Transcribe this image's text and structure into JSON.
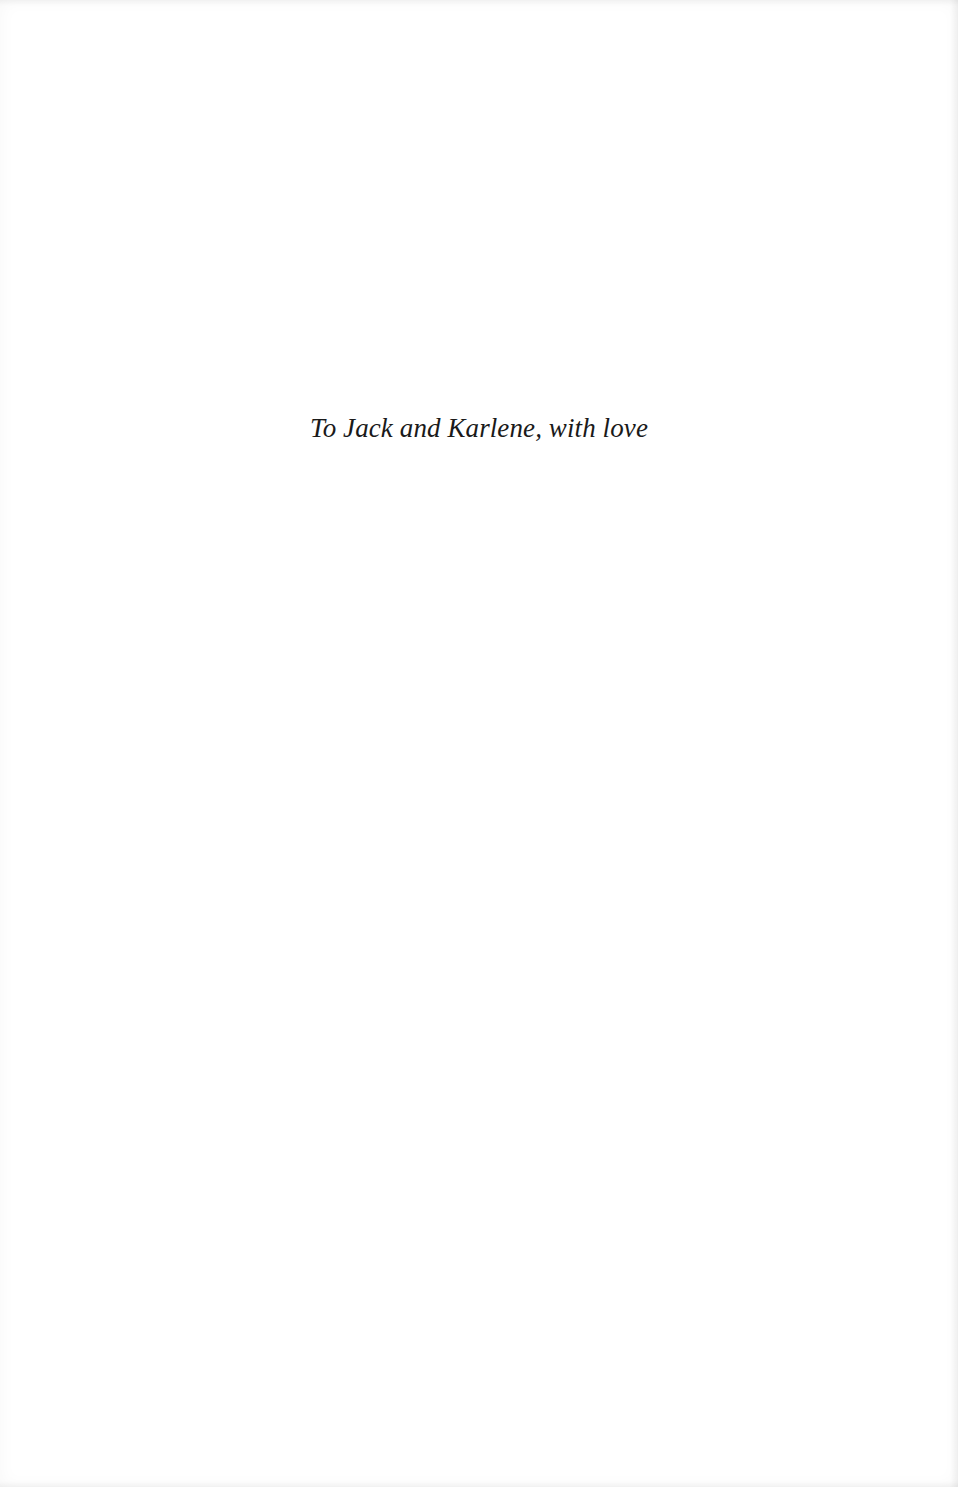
{
  "page": {
    "type": "dedication",
    "background_color": "#ffffff",
    "text_color": "#1a1a1a"
  },
  "dedication": {
    "text": "To Jack and Karlene, with love"
  }
}
